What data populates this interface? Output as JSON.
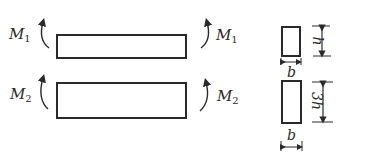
{
  "beams": [
    {
      "left_moment": "M",
      "left_sub": "1",
      "right_moment": "M",
      "right_sub": "1"
    },
    {
      "left_moment": "M",
      "left_sub": "2",
      "right_moment": "M",
      "right_sub": "2"
    }
  ],
  "sections": [
    {
      "width_label": "b",
      "height_label": "h"
    },
    {
      "width_label": "b",
      "height_label": "3h"
    }
  ],
  "colors": {
    "stroke": "#2a2a2a",
    "background": "#ffffff"
  }
}
